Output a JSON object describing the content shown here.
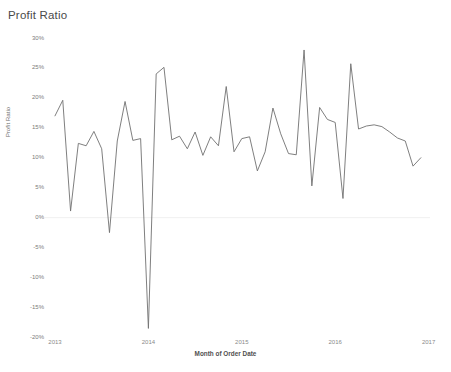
{
  "title": "Profit Ratio",
  "axis": {
    "y_title": "Profit Ratio",
    "x_title": "Month of Order Date"
  },
  "chart_data": {
    "type": "line",
    "title": "Profit Ratio",
    "xlabel": "Month of Order Date",
    "ylabel": "Profit Ratio",
    "ylim": [
      -20,
      30
    ],
    "xlim": [
      "2013",
      "2017"
    ],
    "grid": false,
    "zero_line": true,
    "line_color": "#707070",
    "y_ticks": [
      30,
      25,
      20,
      15,
      10,
      5,
      0,
      -5,
      -10,
      -15,
      -20
    ],
    "y_tick_labels": [
      "30%",
      "25%",
      "20%",
      "15%",
      "10%",
      "5%",
      "0%",
      "-5%",
      "-10%",
      "-15%",
      "-20%"
    ],
    "x_ticks": [
      "2013",
      "2014",
      "2015",
      "2016",
      "2017"
    ],
    "x": [
      "2013-01",
      "2013-02",
      "2013-03",
      "2013-04",
      "2013-05",
      "2013-06",
      "2013-07",
      "2013-08",
      "2013-09",
      "2013-10",
      "2013-11",
      "2013-12",
      "2014-01",
      "2014-02",
      "2014-03",
      "2014-04",
      "2014-05",
      "2014-06",
      "2014-07",
      "2014-08",
      "2014-09",
      "2014-10",
      "2014-11",
      "2014-12",
      "2015-01",
      "2015-02",
      "2015-03",
      "2015-04",
      "2015-05",
      "2015-06",
      "2015-07",
      "2015-08",
      "2015-09",
      "2015-10",
      "2015-11",
      "2015-12",
      "2016-01",
      "2016-02",
      "2016-03",
      "2016-04",
      "2016-05",
      "2016-06",
      "2016-07",
      "2016-08",
      "2016-09",
      "2016-10",
      "2016-11",
      "2016-12"
    ],
    "values": [
      17.0,
      19.6,
      1.1,
      12.4,
      12.0,
      14.4,
      11.5,
      -2.5,
      12.8,
      19.4,
      12.9,
      13.2,
      -18.5,
      24.0,
      25.1,
      13.0,
      13.6,
      11.5,
      14.3,
      10.4,
      13.5,
      12.0,
      21.9,
      11.0,
      13.2,
      13.5,
      7.8,
      11.0,
      18.3,
      14.0,
      10.7,
      10.5,
      28.0,
      5.3,
      18.4,
      16.4,
      15.9,
      3.2,
      25.7,
      14.8,
      15.3,
      15.5,
      15.2,
      14.3,
      13.3,
      12.8,
      8.6,
      10.0
    ],
    "series_name": "Profit Ratio"
  }
}
